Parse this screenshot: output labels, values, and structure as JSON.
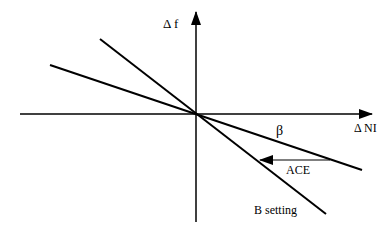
{
  "diagram": {
    "y_axis_label": "Δ f",
    "x_axis_label": "Δ NI",
    "lines": [
      {
        "name": "B setting",
        "label": "B setting"
      },
      {
        "name": "beta",
        "label": "β"
      }
    ],
    "arrow_label": "ACE",
    "colors": {
      "stroke": "#000000",
      "background": "#ffffff"
    }
  }
}
